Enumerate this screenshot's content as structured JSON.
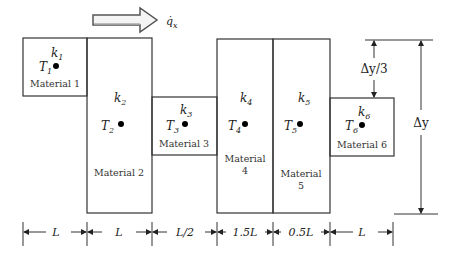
{
  "heat_flux": {
    "label": "q̇",
    "subscript": "x"
  },
  "materials": [
    {
      "k": "k",
      "k_sub": "1",
      "T": "T",
      "T_sub": "1",
      "name": "Material 1",
      "name_line2": ""
    },
    {
      "k": "k",
      "k_sub": "2",
      "T": "T",
      "T_sub": "2",
      "name": "Material 2",
      "name_line2": ""
    },
    {
      "k": "k",
      "k_sub": "3",
      "T": "T",
      "T_sub": "3",
      "name": "Material 3",
      "name_line2": ""
    },
    {
      "k": "k",
      "k_sub": "4",
      "T": "T",
      "T_sub": "4",
      "name": "Material",
      "name_line2": "4"
    },
    {
      "k": "k",
      "k_sub": "5",
      "T": "T",
      "T_sub": "5",
      "name": "Material",
      "name_line2": "5"
    },
    {
      "k": "k",
      "k_sub": "6",
      "T": "T",
      "T_sub": "6",
      "name": "Material 6",
      "name_line2": ""
    }
  ],
  "widths": [
    "L",
    "L",
    "L/2",
    "1.5L",
    "0.5L",
    "L"
  ],
  "vertical_dims": {
    "third": "Δy/3",
    "full": "Δy"
  },
  "colors": {
    "line": "#333333",
    "dot": "#000000"
  }
}
